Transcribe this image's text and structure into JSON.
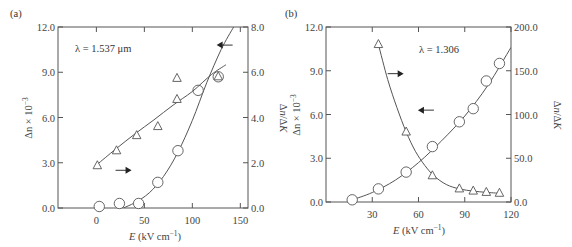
{
  "chart_data": [
    {
      "type": "scatter",
      "panel_label": "(a)",
      "annotation": "λ = 1.537 μm",
      "xlabel": "E (kV cm⁻¹)",
      "xlabel_italic": "E",
      "xlabel_rest": " (kV cm",
      "xlabel_sup": "−1",
      "xlabel_end": ")",
      "ylabel_left": "Δn × 10",
      "ylabel_left_sup": "−3",
      "ylabel_right": "Δn/ΔK",
      "xlim": [
        -40,
        158
      ],
      "ylim_left": [
        0,
        12
      ],
      "ylim_right": [
        0,
        8
      ],
      "xticks": [
        0,
        50,
        100,
        150
      ],
      "xtick_labels": [
        "0",
        "50",
        "100",
        "150"
      ],
      "yticks_left": [
        0,
        3,
        6,
        9,
        12
      ],
      "ytick_labels_left": [
        "0.0",
        "3.0",
        "6.0",
        "9.0",
        "12.0"
      ],
      "yticks_right": [
        0,
        2,
        4,
        6,
        8
      ],
      "ytick_labels_right": [
        "0.0",
        "2.0",
        "4.0",
        "6.0",
        "8.0"
      ],
      "grid": false,
      "series": [
        {
          "name": "Δn × 10⁻³",
          "axis": "left",
          "marker": "circle",
          "points": [
            [
              3,
              0.1
            ],
            [
              24,
              0.3
            ],
            [
              44,
              0.3
            ],
            [
              64,
              1.7
            ],
            [
              85,
              3.8
            ],
            [
              106,
              7.8
            ],
            [
              127,
              8.7
            ]
          ],
          "fit": [
            [
              28,
              0.0
            ],
            [
              40,
              0.35
            ],
            [
              55,
              1.0
            ],
            [
              70,
              2.1
            ],
            [
              85,
              3.7
            ],
            [
              100,
              5.8
            ],
            [
              115,
              8.3
            ],
            [
              130,
              10.5
            ],
            [
              143,
              12.0
            ]
          ]
        },
        {
          "name": "Δn/ΔK",
          "axis": "right",
          "marker": "triangle",
          "points": [
            [
              1,
              1.87
            ],
            [
              21,
              2.53
            ],
            [
              42,
              3.2
            ],
            [
              64,
              3.6
            ],
            [
              84,
              4.8
            ],
            [
              84,
              5.73
            ],
            [
              127,
              5.8
            ]
          ],
          "fit": [
            [
              1,
              1.93
            ],
            [
              20,
              2.6
            ],
            [
              40,
              3.27
            ],
            [
              60,
              3.9
            ],
            [
              80,
              4.55
            ],
            [
              100,
              5.15
            ],
            [
              120,
              5.9
            ],
            [
              135,
              6.33
            ]
          ]
        }
      ],
      "arrows": [
        {
          "direction": "left",
          "points_to": "left axis",
          "at": [
            142,
            10.8
          ]
        },
        {
          "direction": "right",
          "points_to": "right axis",
          "at": [
            20,
            2.5
          ]
        }
      ]
    },
    {
      "type": "scatter",
      "panel_label": "(b)",
      "annotation": "λ = 1.306",
      "xlabel": "E (kV cm⁻¹)",
      "xlabel_italic": "E",
      "xlabel_rest": " (kV cm",
      "xlabel_sup": "−1",
      "xlabel_end": ")",
      "ylabel_left": "Δn × 10",
      "ylabel_left_sup": "−3",
      "ylabel_right": "Δn/ΔK",
      "xlim": [
        0,
        120
      ],
      "ylim_left": [
        0,
        12
      ],
      "ylim_right": [
        0,
        200
      ],
      "xticks": [
        30,
        60,
        90,
        120
      ],
      "xtick_labels": [
        "30",
        "60",
        "90",
        "120"
      ],
      "yticks_left": [
        0,
        3,
        6,
        9,
        12
      ],
      "ytick_labels_left": [
        "0.0",
        "3.0",
        "6.0",
        "9.0",
        "12.0"
      ],
      "yticks_right": [
        0,
        50,
        100,
        150,
        200
      ],
      "ytick_labels_right": [
        "0.0",
        "50.0",
        "100.0",
        "150.0",
        "200.0"
      ],
      "grid": false,
      "series": [
        {
          "name": "Δn × 10⁻³",
          "axis": "left",
          "marker": "circle",
          "points": [
            [
              17,
              0.15
            ],
            [
              34,
              0.9
            ],
            [
              52,
              2.05
            ],
            [
              69,
              3.8
            ],
            [
              86.5,
              5.5
            ],
            [
              95.5,
              6.4
            ],
            [
              104,
              8.3
            ],
            [
              112.5,
              9.5
            ]
          ],
          "fit": [
            [
              17,
              0.15
            ],
            [
              30,
              0.65
            ],
            [
              45,
              1.5
            ],
            [
              60,
              2.7
            ],
            [
              75,
              4.2
            ],
            [
              90,
              5.9
            ],
            [
              105,
              8.0
            ],
            [
              120,
              10.6
            ]
          ]
        },
        {
          "name": "Δn/ΔK",
          "axis": "right",
          "marker": "triangle",
          "points": [
            [
              34,
              180
            ],
            [
              52,
              80
            ],
            [
              69,
              30
            ],
            [
              86.5,
              15
            ],
            [
              95.5,
              12.5
            ],
            [
              104,
              11
            ],
            [
              112.5,
              10
            ]
          ],
          "fit": [
            [
              34,
              180
            ],
            [
              40,
              140
            ],
            [
              46,
              108
            ],
            [
              52,
              80
            ],
            [
              58,
              58
            ],
            [
              64,
              42
            ],
            [
              70,
              30
            ],
            [
              78,
              20
            ],
            [
              86.5,
              15
            ],
            [
              95.5,
              12.5
            ],
            [
              104,
              11
            ],
            [
              112.5,
              10
            ]
          ]
        }
      ],
      "arrows": [
        {
          "direction": "right",
          "points_to": "right axis",
          "at": [
            40,
            8.8
          ]
        },
        {
          "direction": "left",
          "points_to": "left axis",
          "at": [
            70,
            6.3
          ]
        }
      ]
    }
  ]
}
